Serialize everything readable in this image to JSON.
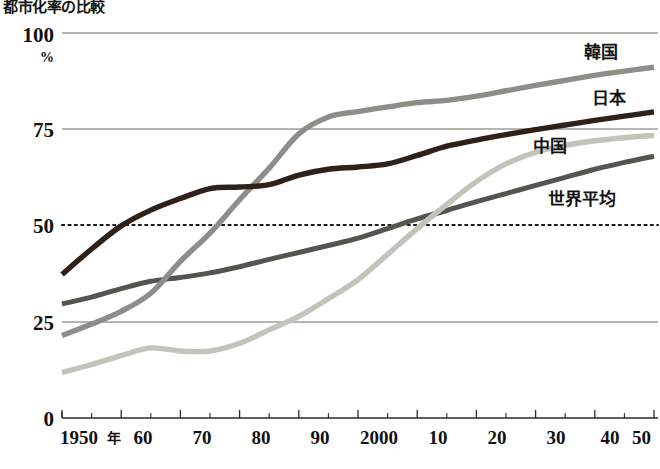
{
  "chart": {
    "title": "都市化率の比較"
  },
  "axes": {
    "y_unit": "%",
    "y_ticks": [
      "0",
      "25",
      "50",
      "75",
      "100"
    ],
    "x_ticks": [
      "1950年",
      "60",
      "70",
      "80",
      "90",
      "2000",
      "10",
      "20",
      "30",
      "40",
      "50"
    ],
    "x_first_label_main": "1950",
    "x_first_label_suffix": "年"
  },
  "series_labels": {
    "korea": "韓国",
    "japan": "日本",
    "china": "中国",
    "world": "世界平均"
  },
  "colors": {
    "korea": "#8e8e88",
    "japan": "#2e2119",
    "china": "#c3c3ba",
    "world": "#55554f",
    "grid": "#6e6e68",
    "axis": "#2a2a2a",
    "text": "#111111",
    "background": "#ffffff"
  },
  "chart_data": {
    "type": "line",
    "title": "都市化率の比較",
    "xlabel": "",
    "ylabel": "%",
    "xlim": [
      1950,
      2050
    ],
    "ylim": [
      0,
      100
    ],
    "grid": true,
    "legend": "inline-right-end-labels",
    "x": [
      1950,
      1955,
      1960,
      1965,
      1970,
      1975,
      1980,
      1985,
      1990,
      1995,
      2000,
      2005,
      2010,
      2015,
      2020,
      2025,
      2030,
      2035,
      2040,
      2045,
      2050
    ],
    "series": [
      {
        "name": "韓国",
        "color": "#8e8e88",
        "values": [
          21.4,
          24.4,
          27.7,
          32.4,
          40.7,
          48.0,
          56.7,
          64.9,
          73.8,
          78.2,
          79.6,
          80.8,
          81.9,
          82.5,
          83.6,
          85.0,
          86.4,
          87.7,
          89.0,
          90.1,
          91.1
        ]
      },
      {
        "name": "日本",
        "color": "#2e2119",
        "values": [
          37.3,
          43.9,
          49.9,
          54.0,
          57.0,
          59.6,
          60.0,
          60.6,
          63.1,
          64.6,
          65.2,
          66.0,
          68.2,
          70.6,
          72.2,
          73.6,
          74.9,
          76.1,
          77.3,
          78.4,
          79.5
        ]
      },
      {
        "name": "中国",
        "color": "#c3c3ba",
        "values": [
          11.8,
          13.9,
          16.2,
          18.2,
          17.4,
          17.4,
          19.4,
          22.9,
          26.4,
          31.0,
          35.9,
          42.5,
          49.2,
          55.5,
          61.4,
          66.0,
          69.0,
          70.8,
          72.0,
          72.8,
          73.4
        ]
      },
      {
        "name": "世界平均",
        "color": "#55554f",
        "values": [
          29.6,
          31.4,
          33.6,
          35.5,
          36.5,
          37.7,
          39.3,
          41.2,
          43.0,
          44.8,
          46.7,
          49.2,
          51.7,
          53.9,
          56.2,
          58.3,
          60.4,
          62.5,
          64.6,
          66.4,
          68.0
        ]
      }
    ]
  }
}
